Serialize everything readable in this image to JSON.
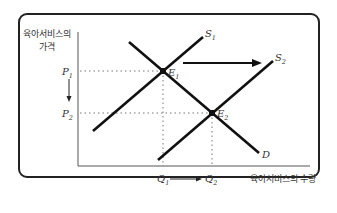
{
  "diagram": {
    "type": "supply-demand-shift",
    "y_axis_label_line1": "육아서비스의",
    "y_axis_label_line2": "가격",
    "x_axis_label": "육아서비스의 수량",
    "price_labels": {
      "p1": "P",
      "p1_sub": "1",
      "p2": "P",
      "p2_sub": "2"
    },
    "quantity_labels": {
      "q1": "Q",
      "q1_sub": "1",
      "q2": "Q",
      "q2_sub": "2"
    },
    "curves": {
      "s1": {
        "name": "S",
        "sub": "1"
      },
      "s2": {
        "name": "S",
        "sub": "2"
      },
      "d": {
        "name": "D"
      }
    },
    "equilibria": {
      "e1": {
        "name": "E",
        "sub": "1"
      },
      "e2": {
        "name": "E",
        "sub": "2"
      }
    },
    "colors": {
      "line": "#111111",
      "frame": "#222222",
      "text": "#333333",
      "guide": "#777777"
    }
  }
}
